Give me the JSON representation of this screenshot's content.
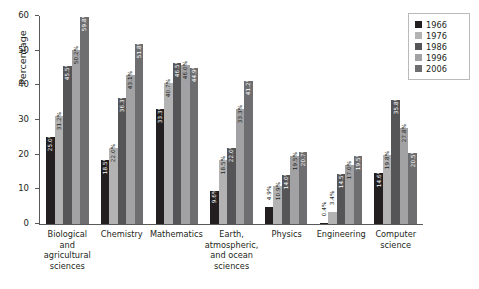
{
  "chart_data": {
    "type": "bar",
    "title": "",
    "xlabel": "",
    "ylabel": "Percentage",
    "ylim": [
      0,
      60
    ],
    "ytick_labels": [
      "0",
      "10",
      "20",
      "30",
      "40",
      "50",
      "60"
    ],
    "yticks": [
      0,
      10,
      20,
      30,
      40,
      50,
      60
    ],
    "grid": false,
    "legend_position": "top-right",
    "categories": [
      "Biological and agricultural sciences",
      "Chemistry",
      "Mathematics",
      "Earth, atmospheric, and ocean sciences",
      "Physics",
      "Engineering",
      "Computer science"
    ],
    "category_lines": [
      [
        "Biological and",
        "agricultural",
        "sciences"
      ],
      [
        "Chemistry"
      ],
      [
        "Mathematics"
      ],
      [
        "Earth,",
        "atmospheric,",
        "and ocean",
        "sciences"
      ],
      [
        "Physics"
      ],
      [
        "Engineering"
      ],
      [
        "Computer",
        "science"
      ]
    ],
    "series": [
      {
        "name": "1966",
        "color": "#231f20",
        "values": [
          25.0,
          18.5,
          33.3,
          9.6,
          4.9,
          0.4,
          14.6
        ],
        "labels": [
          "25.0%",
          "18.5%",
          "33.3%",
          "9.6%",
          "4.9%",
          "0.4%",
          "14.6%"
        ]
      },
      {
        "name": "1976",
        "color": "#b3b3b3",
        "values": [
          31.2,
          22.0,
          40.7,
          18.5,
          10.9,
          3.4,
          19.8
        ],
        "labels": [
          "31.2%",
          "22.0%",
          "40.7%",
          "18.5%",
          "10.9%",
          "3.4%",
          "19.8%"
        ]
      },
      {
        "name": "1986",
        "color": "#555558",
        "values": [
          45.5,
          36.3,
          46.5,
          22.0,
          14.0,
          14.5,
          35.8
        ],
        "labels": [
          "45.5%",
          "36.3%",
          "46.5%",
          "22.0%",
          "14.0%",
          "14.5%",
          "35.8%"
        ]
      },
      {
        "name": "1996",
        "color": "#a2a2a4",
        "values": [
          50.2,
          43.1,
          46.0,
          33.3,
          19.5,
          17.0,
          27.8
        ],
        "labels": [
          "50.2%",
          "43.1%",
          "46.0%",
          "33.3%",
          "19.5%",
          "17.0%",
          "27.8%"
        ]
      },
      {
        "name": "2006",
        "color": "#6e6e70",
        "values": [
          59.8,
          51.8,
          44.9,
          41.2,
          20.7,
          19.5,
          20.5
        ],
        "labels": [
          "59.8%",
          "51.8%",
          "44.9%",
          "41.2%",
          "20.7%",
          "19.5%",
          "20.5%"
        ]
      }
    ]
  }
}
